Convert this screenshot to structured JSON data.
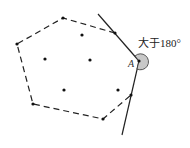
{
  "diagram": {
    "angle_label": "大于180°",
    "point_label": "A",
    "hull_vertices": [
      [
        63,
        18
      ],
      [
        17,
        44
      ],
      [
        33,
        104
      ],
      [
        103,
        119
      ],
      [
        131,
        95
      ],
      [
        139,
        61
      ],
      [
        115,
        33
      ]
    ],
    "interior_points": [
      [
        82,
        35
      ],
      [
        45,
        59
      ],
      [
        90,
        60
      ],
      [
        64,
        90
      ],
      [
        118,
        90
      ]
    ],
    "colors": {
      "stroke": "#222222",
      "angle_fill": "#c8c8c8"
    }
  }
}
